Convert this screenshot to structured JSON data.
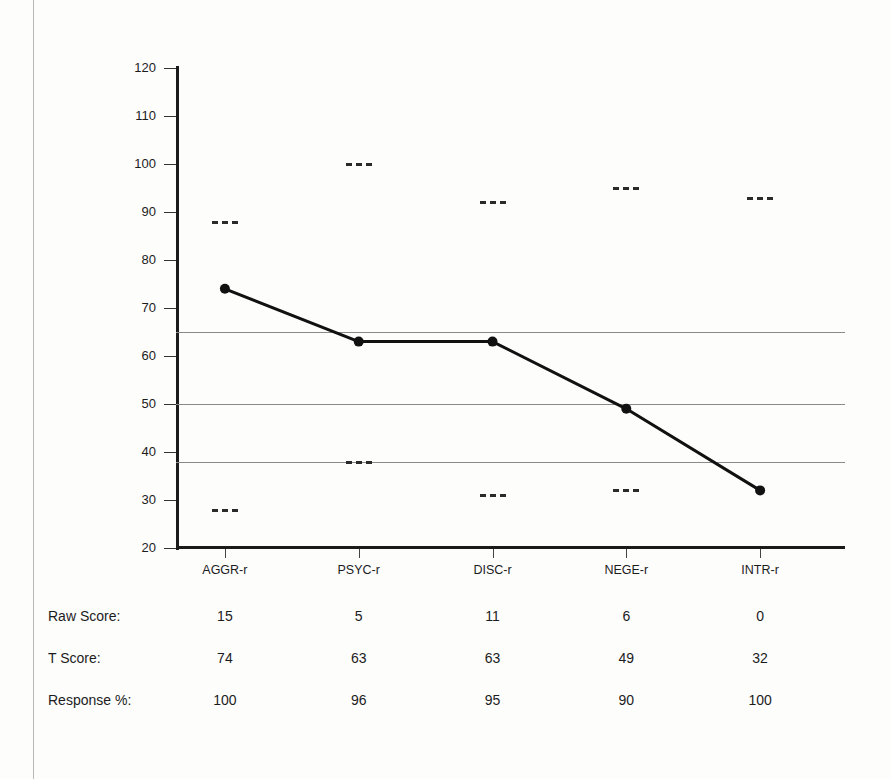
{
  "chart_data": {
    "type": "line",
    "title": "",
    "xlabel": "",
    "ylabel": "",
    "ylim": [
      20,
      120
    ],
    "ytick_step": 10,
    "yticks": [
      120,
      110,
      100,
      90,
      80,
      70,
      60,
      50,
      40,
      30,
      20
    ],
    "grid": true,
    "gridlines": [
      65,
      50,
      38
    ],
    "legend": "none",
    "categories": [
      "AGGR-r",
      "PSYC-r",
      "DISC-r",
      "NEGE-r",
      "INTR-r"
    ],
    "series": [
      {
        "name": "T Score",
        "values": [
          74,
          63,
          63,
          49,
          32
        ],
        "marker": "filled-circle",
        "color": "#111111"
      }
    ],
    "confidence_interval_upper": [
      88,
      100,
      92,
      95,
      93
    ],
    "confidence_interval_lower": [
      28,
      38,
      31,
      32,
      18
    ]
  },
  "table": {
    "column_headers": [
      "AGGR-r",
      "PSYC-r",
      "DISC-r",
      "NEGE-r",
      "INTR-r"
    ],
    "rows": [
      {
        "label": "Raw Score:",
        "values": [
          "15",
          "5",
          "11",
          "6",
          "0"
        ]
      },
      {
        "label": "T Score:",
        "values": [
          "74",
          "63",
          "63",
          "49",
          "32"
        ]
      },
      {
        "label": "Response %:",
        "values": [
          "100",
          "96",
          "95",
          "90",
          "100"
        ]
      }
    ]
  },
  "colors": {
    "line": "#111111",
    "axis": "#1a1a1a",
    "gridline": "#8a8a8a",
    "text": "#1c1c1c",
    "page_border": "#b9b9b9"
  }
}
